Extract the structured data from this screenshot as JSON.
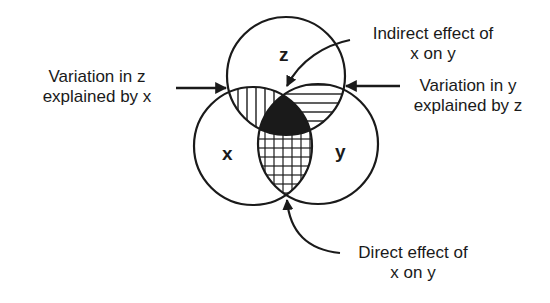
{
  "diagram": {
    "circles": [
      {
        "id": "z",
        "label": "z"
      },
      {
        "id": "x",
        "label": "x"
      },
      {
        "id": "y",
        "label": "y"
      }
    ],
    "annotations": {
      "variation_z_by_x": {
        "line1": "Variation in z",
        "line2": "explained by x"
      },
      "indirect_effect": {
        "line1": "Indirect effect of",
        "line2": "x on y"
      },
      "variation_y_by_z": {
        "line1": "Variation in y",
        "line2": "explained by z"
      },
      "direct_effect": {
        "line1": "Direct effect of",
        "line2": "x on y"
      }
    },
    "regions": {
      "z_and_x_only": "vertical-hatch",
      "z_and_y_only": "horizontal-hatch",
      "x_y_z": "solid-black",
      "x_and_y_only": "cross-hatch"
    },
    "colors": {
      "ink": "#1a1a1a",
      "background": "#ffffff"
    }
  }
}
